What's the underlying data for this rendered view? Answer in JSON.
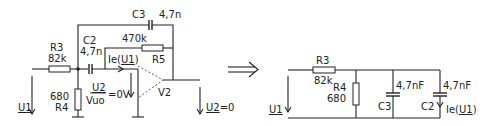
{
  "left_circuit": {
    "R3": {
      "name": "R3",
      "value": "82k"
    },
    "R4": {
      "name": "R4",
      "value": "680"
    },
    "R5": {
      "name": "R5",
      "value": "470k"
    },
    "C2": {
      "name": "C2",
      "value": "4,7n"
    },
    "C3": {
      "name": "C3",
      "value": "4,7n"
    },
    "opamp": "V2",
    "input_voltage": "U1",
    "output_voltage": "U2=0",
    "current": {
      "prefix": "Ie(",
      "u": "U1",
      "suffix": ")"
    },
    "diff_voltage": {
      "num": "U2",
      "den": "Vuo",
      "eq": "=0V"
    }
  },
  "arrow": "⟹",
  "right_circuit": {
    "R3": {
      "name": "R3",
      "value": "82k"
    },
    "R4": {
      "name": "R4",
      "value": "680"
    },
    "C3": {
      "name": "C3",
      "value": "4,7nF"
    },
    "C2": {
      "name": "C2",
      "value": "4,7nF"
    },
    "input_voltage": "U1",
    "current": {
      "prefix": "Ie(",
      "u": "U1",
      "suffix": ")"
    }
  }
}
